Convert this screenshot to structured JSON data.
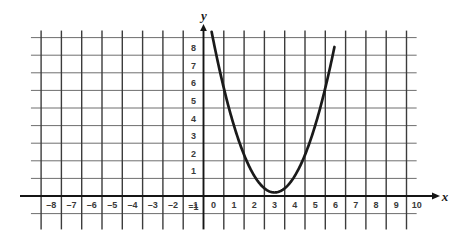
{
  "chart_data": {
    "type": "line",
    "title": "",
    "subtitle": "",
    "xlabel": "x",
    "ylabel": "y",
    "xlim": [
      -8.7,
      10.6
    ],
    "ylim": [
      -1.6,
      9.6
    ],
    "grid": true,
    "grid_spacing": 1,
    "legend": "none",
    "x_tick_labels": [
      "-8",
      "-7",
      "-6",
      "-5",
      "-4",
      "-3",
      "-2",
      "-1",
      "0",
      "1",
      "2",
      "3",
      "4",
      "5",
      "6",
      "7",
      "8",
      "9",
      "10"
    ],
    "x_tick_values": [
      -8,
      -7,
      -6,
      -5,
      -4,
      -3,
      -2,
      -1,
      0,
      1,
      2,
      3,
      4,
      5,
      6,
      7,
      8,
      9,
      10
    ],
    "y_tick_labels": [
      "-1",
      "1",
      "2",
      "3",
      "4",
      "5",
      "6",
      "7",
      "8"
    ],
    "y_tick_values": [
      -1,
      1,
      2,
      3,
      4,
      5,
      6,
      7,
      8
    ],
    "series": [
      {
        "name": "parabola",
        "type": "parabola",
        "color": "#1a1a1a",
        "vertex": [
          3.5,
          0.2
        ],
        "leading_coefficient": 0.95,
        "equation": "y = 0.95(x - 3.5)^2 + 0.2",
        "x_range": [
          0.4,
          6.45
        ],
        "x": [
          0.4,
          0.7,
          1.0,
          1.3,
          1.6,
          1.9,
          2.2,
          2.5,
          2.8,
          3.1,
          3.4,
          3.5,
          3.7,
          4.0,
          4.3,
          4.6,
          4.9,
          5.2,
          5.5,
          5.8,
          6.1,
          6.45
        ],
        "y": [
          9.42,
          8.08,
          6.84,
          5.7,
          4.65,
          2.84,
          1.42,
          1.15,
          0.69,
          0.35,
          0.21,
          0.2,
          0.24,
          0.44,
          0.81,
          1.25,
          2.19,
          3.04,
          4.0,
          5.43,
          6.87,
          8.85
        ]
      }
    ],
    "axes": {
      "x_axis_at_y": 0,
      "y_axis_at_x": 0,
      "x_axis_arrow": true,
      "y_axis_arrow": true
    }
  },
  "labels": {
    "x_axis_name": "x",
    "y_axis_name": "y"
  }
}
